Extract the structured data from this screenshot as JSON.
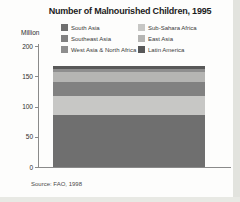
{
  "title": "Number of Malnourished Children, 1995",
  "y_axis": {
    "unit_label": "Million",
    "ticks": [
      0,
      50,
      100,
      150,
      200
    ],
    "max": 200
  },
  "source": "Source: FAO, 1998",
  "legend": {
    "items": [
      {
        "label": "South Asia",
        "color": "#6f6f6f"
      },
      {
        "label": "Sub-Sahara Africa",
        "color": "#c7c7c5"
      },
      {
        "label": "Southeast Asia",
        "color": "#818181"
      },
      {
        "label": "East Asia",
        "color": "#b5b5b3"
      },
      {
        "label": "West Asia & North Africa",
        "color": "#8e8e8e"
      },
      {
        "label": "Latin America",
        "color": "#585858"
      }
    ]
  },
  "chart_data": {
    "type": "bar",
    "subtype": "single-stacked-bar",
    "title": "Number of Malnourished Children, 1995",
    "ylabel": "Million",
    "ylim": [
      0,
      200
    ],
    "grid": false,
    "legend_position": "top",
    "categories": [
      "1995"
    ],
    "series": [
      {
        "name": "South Asia",
        "color": "#6f6f6f",
        "values": [
          86
        ]
      },
      {
        "name": "Sub-Sahara Africa",
        "color": "#c7c7c5",
        "values": [
          32
        ]
      },
      {
        "name": "Southeast Asia",
        "color": "#818181",
        "values": [
          22
        ]
      },
      {
        "name": "East Asia",
        "color": "#b5b5b3",
        "values": [
          17
        ]
      },
      {
        "name": "West Asia & North Africa",
        "color": "#8e8e8e",
        "values": [
          5
        ]
      },
      {
        "name": "Latin America",
        "color": "#585858",
        "values": [
          5
        ]
      }
    ],
    "total": 167
  }
}
